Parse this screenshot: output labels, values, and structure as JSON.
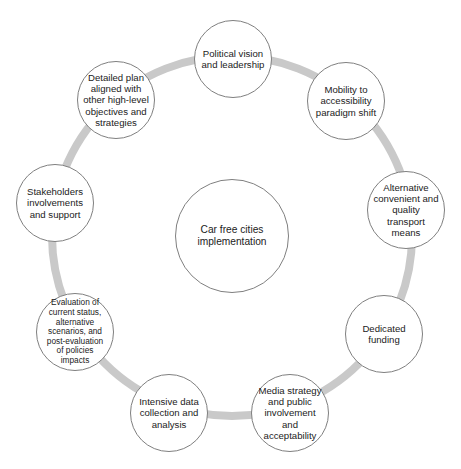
{
  "diagram": {
    "type": "cycle",
    "colors": {
      "background": "#ffffff",
      "ring": "#c9c9c9",
      "node_border": "#7f7f7f",
      "text": "#222222"
    },
    "ring": {
      "cx": 232,
      "cy": 236,
      "r": 180,
      "stroke_width": 8
    },
    "center": {
      "label": "Car free cities\nimplementation",
      "cx": 232,
      "cy": 236,
      "r": 57
    },
    "nodes": [
      {
        "id": "political-vision",
        "label": "Political vision\nand leadership",
        "cx": 233,
        "cy": 59,
        "r": 39,
        "size": "normal"
      },
      {
        "id": "mobility-accessibility",
        "label": "Mobility to\naccessibility\nparadigm shift",
        "cx": 346,
        "cy": 101,
        "r": 39,
        "size": "normal"
      },
      {
        "id": "alternative-transport",
        "label": "Alternative\nconvenient and\nquality\ntransport\nmeans",
        "cx": 406,
        "cy": 210,
        "r": 39,
        "size": "normal"
      },
      {
        "id": "dedicated-funding",
        "label": "Dedicated\nfunding",
        "cx": 384,
        "cy": 334,
        "r": 39,
        "size": "normal"
      },
      {
        "id": "media-strategy",
        "label": "Media strategy\nand public\ninvolvement\nand\nacceptability",
        "cx": 290,
        "cy": 413,
        "r": 39,
        "size": "normal"
      },
      {
        "id": "data-collection",
        "label": "Intensive data\ncollection and\nanalysis",
        "cx": 169,
        "cy": 413,
        "r": 39,
        "size": "normal"
      },
      {
        "id": "evaluation",
        "label": "Evaluation of\ncurrent status,\nalternative\nscenarios, and\npost-evaluation\nof policies\nimpacts",
        "cx": 75,
        "cy": 332,
        "r": 39,
        "size": "small"
      },
      {
        "id": "stakeholders",
        "label": "Stakeholders\ninvolvements\nand support",
        "cx": 55,
        "cy": 203,
        "r": 39,
        "size": "normal"
      },
      {
        "id": "detailed-plan",
        "label": "Detailed plan\naligned with\nother high-level\nobjectives and\nstrategies",
        "cx": 116,
        "cy": 100,
        "r": 39,
        "size": "normal"
      }
    ]
  }
}
